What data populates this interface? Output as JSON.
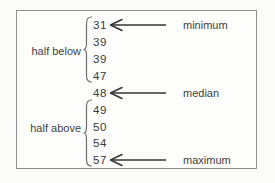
{
  "diagram": {
    "numbers": [
      "31",
      "39",
      "39",
      "47",
      "48",
      "49",
      "50",
      "54",
      "57"
    ],
    "groups": [
      {
        "label": "half below",
        "covers": [
          "31",
          "39",
          "39",
          "47"
        ]
      },
      {
        "label": "half above",
        "covers": [
          "49",
          "50",
          "54",
          "57"
        ]
      }
    ],
    "annotations": [
      {
        "label": "minimum",
        "points_to": "31"
      },
      {
        "label": "median",
        "points_to": "48"
      },
      {
        "label": "maximum",
        "points_to": "57"
      }
    ],
    "colors": {
      "text": "#3a3a3a",
      "border": "#8f8f8f",
      "brace": "#6f6f6f",
      "arrow": "#353535",
      "background": "#fbfbf9"
    }
  }
}
